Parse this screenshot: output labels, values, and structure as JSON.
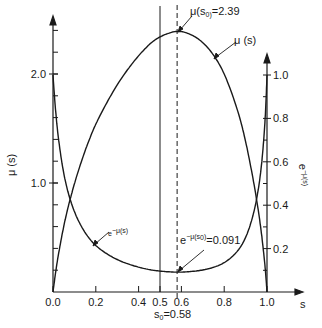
{
  "chart_data": {
    "type": "line",
    "title": "",
    "xlabel": "s",
    "ylabel_left": "μ(s)",
    "ylabel_right": "e^{-μ(s)}",
    "xlim": [
      0,
      1
    ],
    "ylim_left": [
      0,
      2.5
    ],
    "ylim_right": [
      0,
      1.1
    ],
    "grid": false,
    "x_ticks": [
      "0.0",
      "0.2",
      "0.4",
      "0.5",
      "0.6",
      "0.8",
      "1.0"
    ],
    "x_tick_values": [
      0.0,
      0.2,
      0.4,
      0.5,
      0.6,
      0.8,
      1.0
    ],
    "y_left_ticks": [
      "1.0",
      "2.0"
    ],
    "y_left_tick_values": [
      1.0,
      2.0
    ],
    "y_left_minor_step": 0.2,
    "y_right_ticks": [
      "0.2",
      "0.4",
      "0.6",
      "0.8",
      "1.0"
    ],
    "y_right_tick_values": [
      0.2,
      0.4,
      0.6,
      0.8,
      1.0
    ],
    "series": [
      {
        "name": "μ(s)",
        "axis": "left",
        "x": [
          0.0,
          0.02,
          0.05,
          0.08,
          0.12,
          0.17,
          0.22,
          0.3,
          0.38,
          0.45,
          0.5,
          0.55,
          0.58,
          0.62,
          0.68,
          0.74,
          0.8,
          0.86,
          0.9,
          0.94,
          0.97,
          0.99,
          1.0
        ],
        "values": [
          0.0,
          0.28,
          0.6,
          0.85,
          1.12,
          1.4,
          1.62,
          1.9,
          2.12,
          2.27,
          2.34,
          2.38,
          2.39,
          2.38,
          2.32,
          2.2,
          2.0,
          1.68,
          1.38,
          0.98,
          0.6,
          0.25,
          0.0
        ]
      },
      {
        "name": "e^{-μ(s)}",
        "axis": "right",
        "derived_from": "μ(s)",
        "formula": "exp(-mu)"
      }
    ],
    "annotations": [
      {
        "text": "μ(s₀)=2.39",
        "x": 0.58,
        "y": 2.39
      },
      {
        "text": "μ(s)",
        "x": 0.74,
        "y": 2.2
      },
      {
        "text": "e^{-μ(s)}",
        "x": 0.17,
        "y": 0.24
      },
      {
        "text": "e^{-μ(s₀)}=0.091",
        "x": 0.58,
        "y": 0.091
      },
      {
        "text": "s₀=0.58",
        "x": 0.58
      }
    ],
    "vertical_lines": [
      {
        "x": 0.5,
        "style": "solid"
      },
      {
        "x": 0.58,
        "style": "dashed"
      }
    ]
  },
  "labels": {
    "x_axis": "s",
    "left_axis": "μ (s)",
    "right_axis": "e",
    "right_axis_sup": "−μ(s)",
    "peak_mu": "μ(s",
    "peak_mu_sub": "0)",
    "peak_value": "=2.39",
    "mu_curve": "μ (s)",
    "exp_curve_base": "e",
    "exp_curve_sup": "−μ(s)",
    "min_base": "e",
    "min_sup": "−μ(s",
    "min_sup_sub": "0",
    "min_sup_close": ")",
    "min_value": "=0.091",
    "s0_label": "s",
    "s0_sub": "0",
    "s0_value": "=0.58"
  }
}
